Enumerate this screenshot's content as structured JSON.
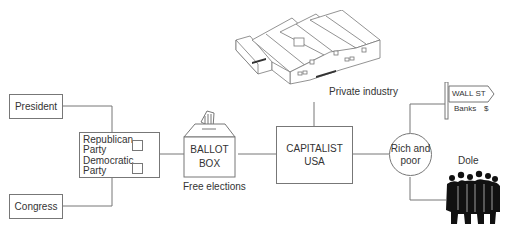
{
  "diagram": {
    "nodes": {
      "president": {
        "label": "President"
      },
      "congress": {
        "label": "Congress"
      },
      "parties": {
        "republican": "Republican Party",
        "republican_line1": "Republican",
        "republican_line2": "Party",
        "democratic": "Democratic Party",
        "democratic_line1": "Democratic",
        "democratic_line2": "Party"
      },
      "ballot_box": {
        "line1": "BALLOT",
        "line2": "BOX",
        "caption": "Free elections"
      },
      "capitalist_usa": {
        "line1": "CAPITALIST",
        "line2": "USA"
      },
      "private_industry": {
        "caption": "Private industry"
      },
      "rich_and_poor": {
        "line1": "Rich and",
        "line2": "poor"
      },
      "wall_st": {
        "sign": "WALL ST",
        "sub_label": "Banks",
        "symbol": "$"
      },
      "dole": {
        "caption": "Dole"
      }
    },
    "edges": [
      [
        "president",
        "parties"
      ],
      [
        "congress",
        "parties"
      ],
      [
        "parties",
        "ballot_box"
      ],
      [
        "ballot_box",
        "capitalist_usa"
      ],
      [
        "private_industry",
        "capitalist_usa"
      ],
      [
        "capitalist_usa",
        "rich_and_poor"
      ],
      [
        "rich_and_poor",
        "wall_st"
      ],
      [
        "rich_and_poor",
        "dole"
      ]
    ],
    "colors": {
      "line": "#777777",
      "text": "#333333",
      "crowd": "#111111"
    }
  }
}
